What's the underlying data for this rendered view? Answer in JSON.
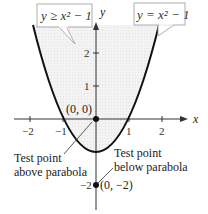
{
  "figure": {
    "region_label": "y ≥ x² − 1",
    "curve_label": "y = x² − 1",
    "axis_x_label": "x",
    "axis_y_label": "y",
    "x_ticks": [
      "−2",
      "−1",
      "1",
      "2"
    ],
    "y_ticks": [
      "2",
      "1",
      "−2"
    ],
    "point_origin_label": "(0, 0)",
    "point_below_label": "(0, −2)",
    "annotation_above_line1": "Test point",
    "annotation_above_line2": "above parabola",
    "annotation_below_line1": "Test point",
    "annotation_below_line2": "below parabola",
    "colors": {
      "shade": "#eeeeee",
      "curve": "#111111",
      "axis": "#333333",
      "box_border": "#999999"
    }
  }
}
